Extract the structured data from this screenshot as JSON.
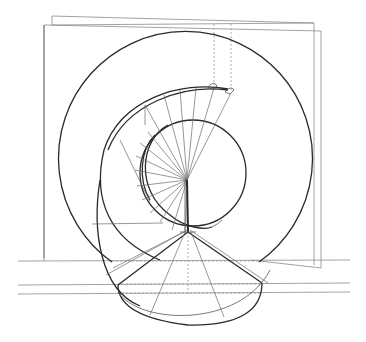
{
  "figure": {
    "title": "",
    "colors": {
      "background": "#ffffff",
      "line_bold": "#2a2a2a",
      "line_thin": "#8a8a8a",
      "line_dashed": "#9a9a9a"
    },
    "elements": {
      "wall_planes": 2,
      "outer_circle": {
        "cx": 186,
        "cy": 160,
        "r": 127
      },
      "inner_circle": {
        "cx": 193,
        "cy": 173,
        "r": 53
      },
      "center_point": {
        "x": 187,
        "y": 180
      },
      "cone_apex": {
        "x": 188,
        "y": 232
      },
      "horizontal_ground_lines": 3,
      "dashed_projection_lines": true
    }
  }
}
